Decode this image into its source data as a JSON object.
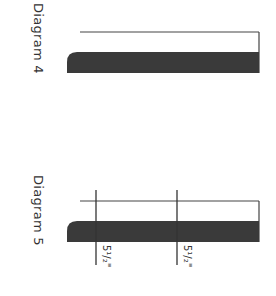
{
  "diagrams": [
    {
      "label": "Diagram 4",
      "shapes": {
        "top_line": {
          "x1": 80,
          "x2": 259,
          "y": 32
        },
        "right_edge": {
          "x": 259,
          "y1": 32,
          "y2": 73
        },
        "bar": {
          "x1": 67,
          "x2": 259,
          "y1": 52,
          "y2": 73,
          "fill": "#3a3a3a"
        }
      }
    },
    {
      "label": "Diagram 5",
      "shapes": {
        "top_line": {
          "x1": 80,
          "x2": 259,
          "y": 201
        },
        "right_edge": {
          "x": 259,
          "y1": 201,
          "y2": 242
        },
        "bar": {
          "x1": 67,
          "x2": 259,
          "y1": 221,
          "y2": 242,
          "fill": "#3a3a3a"
        },
        "markers": [
          {
            "x": 96,
            "y1": 190,
            "y2": 265,
            "label": "5¹/₂\""
          },
          {
            "x": 177,
            "y1": 190,
            "y2": 265,
            "label": "5¹/₂\""
          }
        ]
      }
    }
  ]
}
